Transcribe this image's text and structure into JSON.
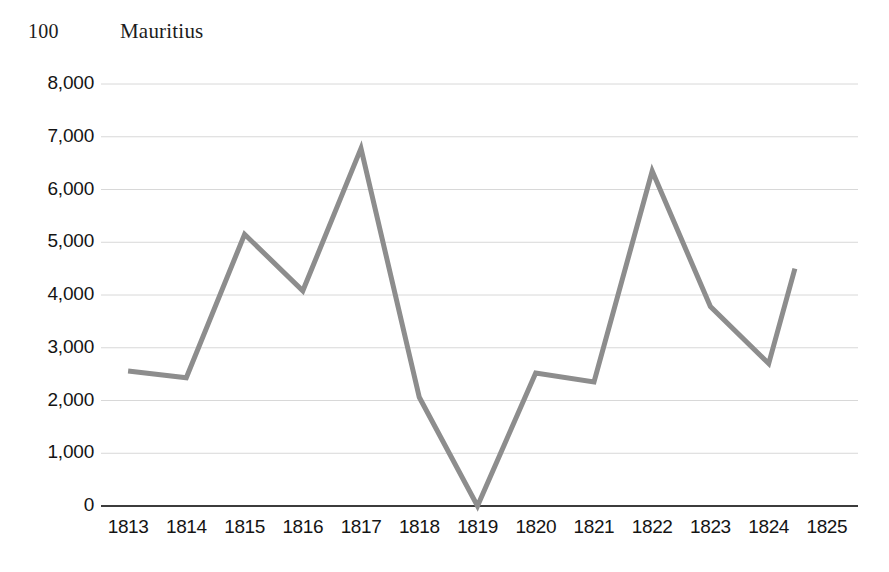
{
  "header": {
    "figure_number": "100",
    "title": "Mauritius"
  },
  "chart_data": {
    "type": "line",
    "title": "Mauritius",
    "figure_number": "100",
    "xlabel": "",
    "ylabel": "",
    "x": [
      1813,
      1814,
      1815,
      1816,
      1817,
      1818,
      1819,
      1820,
      1821,
      1822,
      1823,
      1824,
      1825
    ],
    "categories": [
      "1813",
      "1814",
      "1815",
      "1816",
      "1817",
      "1818",
      "1819",
      "1820",
      "1821",
      "1822",
      "1823",
      "1824",
      "1825"
    ],
    "values": [
      2560,
      2430,
      5150,
      4080,
      6780,
      2060,
      0,
      2520,
      2350,
      6350,
      3780,
      2700,
      4500
    ],
    "series": [
      {
        "name": "Mauritius",
        "color": "#8d8d8d",
        "values": [
          2560,
          2430,
          5150,
          4080,
          6780,
          2060,
          0,
          2520,
          2350,
          6350,
          3780,
          2700,
          4500
        ]
      }
    ],
    "ylim": [
      0,
      8000
    ],
    "ytick_values": [
      0,
      1000,
      2000,
      3000,
      4000,
      5000,
      6000,
      7000,
      8000
    ],
    "ytick_labels": [
      "0",
      "1,000",
      "2,000",
      "3,000",
      "4,000",
      "5,000",
      "6,000",
      "7,000",
      "8,000"
    ],
    "xtick_labels": [
      "1813",
      "1814",
      "1815",
      "1816",
      "1817",
      "1818",
      "1819",
      "1820",
      "1821",
      "1822",
      "1823",
      "1824",
      "1825"
    ],
    "grid": true,
    "grid_axis": "y",
    "grid_color": "#d8d8d8",
    "legend": false,
    "legend_position": "none",
    "line_color": "#8d8d8d",
    "line_width": 5,
    "markers": false,
    "axis_color": "#3c3c3c",
    "background": "#ffffff",
    "note_last_point_offset": "final segment ends short of the 1825 tick"
  }
}
